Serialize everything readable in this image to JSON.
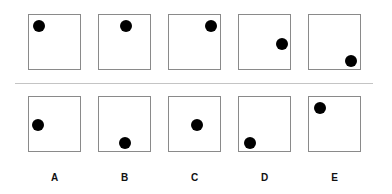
{
  "puzzle": {
    "question_row": [
      {
        "dot": "top-left"
      },
      {
        "dot": "top-center"
      },
      {
        "dot": "top-right"
      },
      {
        "dot": "middle-right"
      },
      {
        "dot": "bottom-right"
      }
    ],
    "answer_row": [
      {
        "label": "A",
        "dot": "middle-left"
      },
      {
        "label": "B",
        "dot": "bottom-center"
      },
      {
        "label": "C",
        "dot": "middle-center"
      },
      {
        "label": "D",
        "dot": "bottom-left"
      },
      {
        "label": "E",
        "dot": "top-left"
      }
    ]
  }
}
